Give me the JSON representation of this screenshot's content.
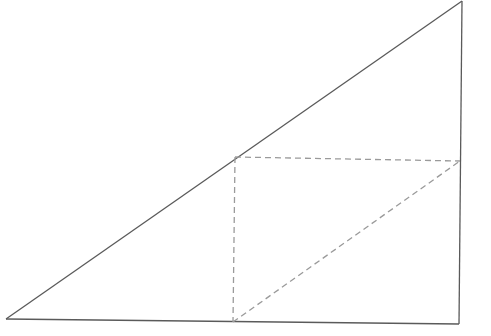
{
  "diagram": {
    "type": "geometry",
    "colors": {
      "solid_stroke": "#5a5a5a",
      "dashed_stroke": "#9a9a9a",
      "background": "#ffffff"
    },
    "triangle": {
      "vertices": {
        "bottom_left": [
          6,
          319
        ],
        "top_right": [
          462,
          1
        ],
        "bottom_right": [
          459,
          324
        ]
      }
    },
    "inscribed_points": {
      "on_hypotenuse": [
        235,
        157
      ],
      "on_right_side": [
        460,
        161
      ],
      "on_base": [
        233,
        322
      ]
    },
    "dashed_segments": [
      {
        "name": "vertical-dashed-line",
        "from": [
          235,
          157
        ],
        "to": [
          233,
          322
        ]
      },
      {
        "name": "horizontal-dashed-line",
        "from": [
          235,
          157
        ],
        "to": [
          460,
          161
        ]
      },
      {
        "name": "diagonal-dashed-line",
        "from": [
          233,
          322
        ],
        "to": [
          460,
          161
        ]
      }
    ],
    "labels": []
  }
}
